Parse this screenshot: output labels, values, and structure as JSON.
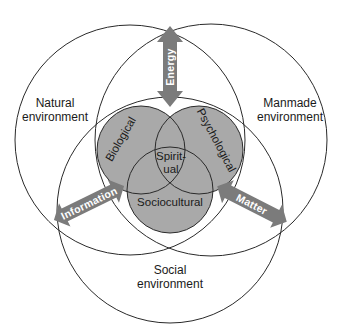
{
  "diagram": {
    "environments": [
      {
        "id": "natural",
        "line1": "Natural",
        "line2": "environment"
      },
      {
        "id": "manmade",
        "line1": "Manmade",
        "line2": "environment"
      },
      {
        "id": "social",
        "line1": "Social",
        "line2": "environment"
      }
    ],
    "domains": {
      "biological": "Biological",
      "psychological": "Psychological",
      "sociocultural": "Sociocultural",
      "spiritual_line1": "Spirit-",
      "spiritual_line2": "ual"
    },
    "flows": {
      "energy": "Energy",
      "information": "Information",
      "matter": "Matter"
    },
    "colors": {
      "inner_fill": "#a9a9a9",
      "arrow_fill": "#7b7b7b",
      "line": "#2a2a2a"
    }
  }
}
